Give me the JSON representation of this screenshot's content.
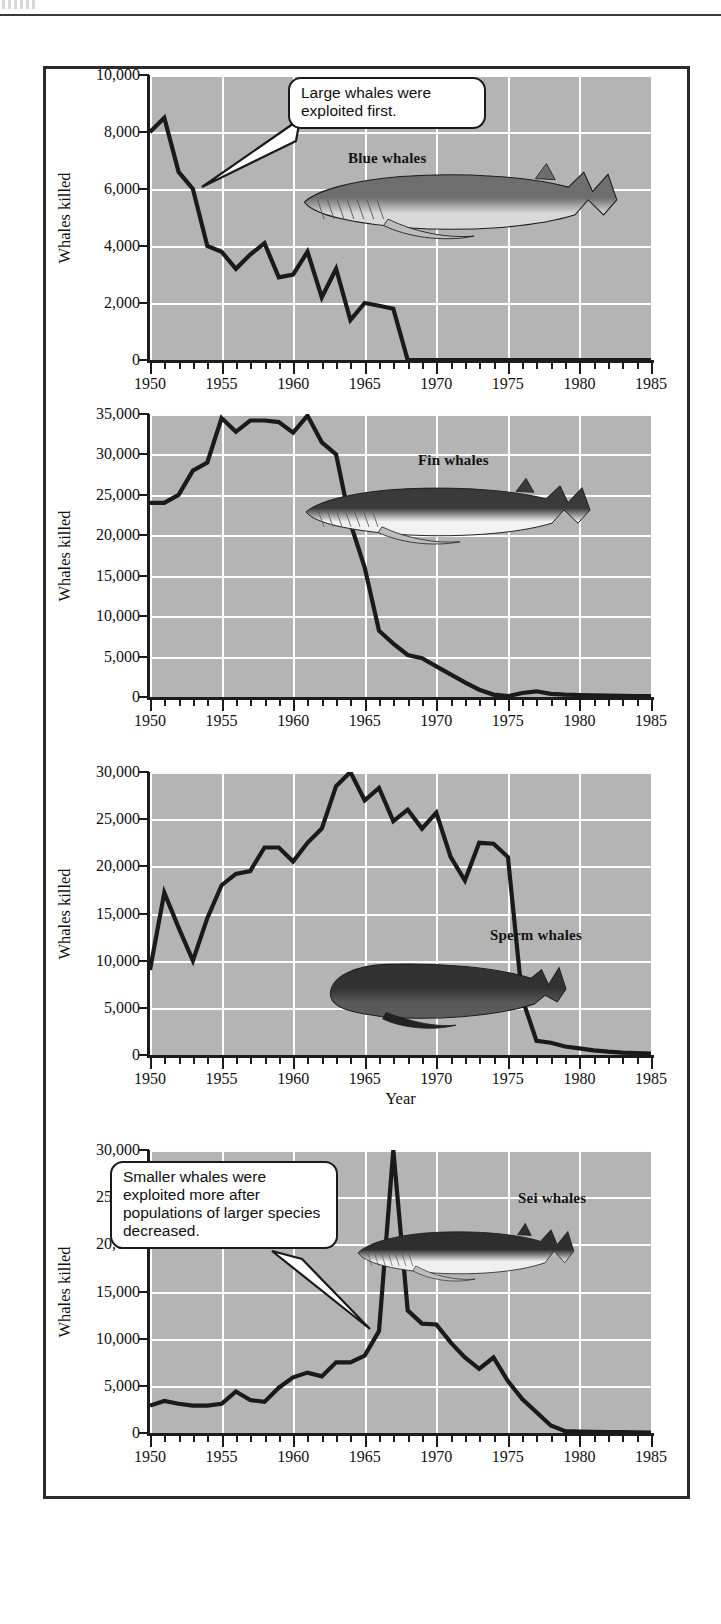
{
  "figure": {
    "ylabel": "Whales killed",
    "xlabel": "Year",
    "xticks": [
      "1950",
      "1955",
      "1960",
      "1965",
      "1970",
      "1975",
      "1980",
      "1985"
    ],
    "plot_bg": "#b4b4b4",
    "gridline_color": "#ffffff",
    "line_color": "#1a1a1a",
    "frame_color": "#2b2b2b"
  },
  "callouts": [
    {
      "id": "callout-large-whales",
      "text": "Large whales were exploited first."
    },
    {
      "id": "callout-smaller-whales",
      "text": "Smaller whales were exploited more after populations of larger species decreased."
    }
  ],
  "chart_data": [
    {
      "type": "line",
      "title": "Blue whales",
      "species_label": "Blue whales",
      "xlabel": "",
      "ylabel": "Whales killed",
      "xlim": [
        1950,
        1985
      ],
      "ylim": [
        0,
        10000
      ],
      "yticks": [
        0,
        2000,
        4000,
        6000,
        8000,
        10000
      ],
      "ytick_labels": [
        "0",
        "2,000",
        "4,000",
        "6,000",
        "8,000",
        "10,000"
      ],
      "xticks": [
        1950,
        1955,
        1960,
        1965,
        1970,
        1975,
        1980,
        1985
      ],
      "grid": true,
      "legend": "none",
      "x": [
        1950,
        1951,
        1952,
        1953,
        1954,
        1955,
        1956,
        1957,
        1958,
        1959,
        1960,
        1961,
        1962,
        1963,
        1964,
        1965,
        1966,
        1967,
        1968,
        1969,
        1970,
        1971,
        1972,
        1973,
        1974,
        1975,
        1976,
        1977,
        1978,
        1979,
        1980,
        1981,
        1982,
        1983,
        1984,
        1985
      ],
      "values": [
        8000,
        8500,
        6600,
        6000,
        4000,
        3800,
        3200,
        3700,
        4100,
        2900,
        3000,
        3800,
        2200,
        3200,
        1400,
        2000,
        1900,
        1800,
        0,
        0,
        0,
        0,
        0,
        0,
        0,
        0,
        0,
        0,
        0,
        0,
        0,
        0,
        0,
        0,
        0,
        0
      ]
    },
    {
      "type": "line",
      "title": "Fin whales",
      "species_label": "Fin whales",
      "xlabel": "",
      "ylabel": "Whales killed",
      "xlim": [
        1950,
        1985
      ],
      "ylim": [
        0,
        35000
      ],
      "yticks": [
        0,
        5000,
        10000,
        15000,
        20000,
        25000,
        30000,
        35000
      ],
      "ytick_labels": [
        "0",
        "5,000",
        "10,000",
        "15,000",
        "20,000",
        "25,000",
        "30,000",
        "35,000"
      ],
      "xticks": [
        1950,
        1955,
        1960,
        1965,
        1970,
        1975,
        1980,
        1985
      ],
      "grid": true,
      "legend": "none",
      "x": [
        1950,
        1951,
        1952,
        1953,
        1954,
        1955,
        1956,
        1957,
        1958,
        1959,
        1960,
        1961,
        1962,
        1963,
        1964,
        1965,
        1966,
        1967,
        1968,
        1969,
        1970,
        1971,
        1972,
        1973,
        1974,
        1975,
        1976,
        1977,
        1978,
        1979,
        1980,
        1981,
        1982,
        1983,
        1984,
        1985
      ],
      "values": [
        24000,
        24000,
        25000,
        28000,
        29000,
        34500,
        32800,
        34200,
        34200,
        34000,
        32700,
        34800,
        31500,
        30000,
        21500,
        16000,
        8200,
        6600,
        5200,
        4800,
        3800,
        2800,
        1800,
        900,
        300,
        100,
        500,
        700,
        400,
        300,
        250,
        200,
        180,
        150,
        120,
        100
      ]
    },
    {
      "type": "line",
      "title": "Sperm whales",
      "species_label": "Sperm whales",
      "xlabel": "Year",
      "ylabel": "Whales killed",
      "xlim": [
        1950,
        1985
      ],
      "ylim": [
        0,
        30000
      ],
      "yticks": [
        0,
        5000,
        10000,
        15000,
        20000,
        25000,
        30000
      ],
      "ytick_labels": [
        "0",
        "5,000",
        "10,000",
        "15,000",
        "20,000",
        "25,000",
        "30,000"
      ],
      "xticks": [
        1950,
        1955,
        1960,
        1965,
        1970,
        1975,
        1980,
        1985
      ],
      "grid": true,
      "legend": "none",
      "x": [
        1950,
        1951,
        1952,
        1953,
        1954,
        1955,
        1956,
        1957,
        1958,
        1959,
        1960,
        1961,
        1962,
        1963,
        1964,
        1965,
        1966,
        1967,
        1968,
        1969,
        1970,
        1971,
        1972,
        1973,
        1974,
        1975,
        1976,
        1977,
        1978,
        1979,
        1980,
        1981,
        1982,
        1983,
        1984,
        1985
      ],
      "values": [
        9000,
        17200,
        13500,
        10000,
        14500,
        18000,
        19200,
        19500,
        22000,
        22000,
        20500,
        22500,
        24000,
        28500,
        30000,
        27000,
        28300,
        24800,
        26000,
        24000,
        25700,
        21000,
        18500,
        22500,
        22400,
        21000,
        6000,
        1500,
        1300,
        900,
        700,
        500,
        350,
        250,
        200,
        150
      ]
    },
    {
      "type": "line",
      "title": "Sei whales",
      "species_label": "Sei whales",
      "xlabel": "",
      "ylabel": "Whales killed",
      "xlim": [
        1950,
        1985
      ],
      "ylim": [
        0,
        30000
      ],
      "yticks": [
        0,
        5000,
        10000,
        15000,
        20000,
        25000,
        30000
      ],
      "ytick_labels": [
        "0",
        "5,000",
        "10,000",
        "15,000",
        "20,000",
        "25,000",
        "30,000"
      ],
      "xticks": [
        1950,
        1955,
        1960,
        1965,
        1970,
        1975,
        1980,
        1985
      ],
      "grid": true,
      "legend": "none",
      "x": [
        1950,
        1951,
        1952,
        1953,
        1954,
        1955,
        1956,
        1957,
        1958,
        1959,
        1960,
        1961,
        1962,
        1963,
        1964,
        1965,
        1966,
        1967,
        1968,
        1969,
        1970,
        1971,
        1972,
        1973,
        1974,
        1975,
        1976,
        1977,
        1978,
        1979,
        1980,
        1981,
        1982,
        1983,
        1984,
        1985
      ],
      "values": [
        2900,
        3400,
        3100,
        2900,
        2900,
        3100,
        4400,
        3500,
        3300,
        4800,
        5900,
        6400,
        6000,
        7500,
        7500,
        8200,
        10800,
        30000,
        13000,
        11600,
        11500,
        9600,
        8000,
        6800,
        8000,
        5500,
        3600,
        2200,
        800,
        200,
        150,
        130,
        100,
        80,
        60,
        50
      ]
    }
  ],
  "whale_illustrations": [
    {
      "name": "blue-whale-illustration",
      "label": "Blue whale"
    },
    {
      "name": "fin-whale-illustration",
      "label": "Fin whale"
    },
    {
      "name": "sperm-whale-illustration",
      "label": "Sperm whale"
    },
    {
      "name": "sei-whale-illustration",
      "label": "Sei whale"
    }
  ]
}
